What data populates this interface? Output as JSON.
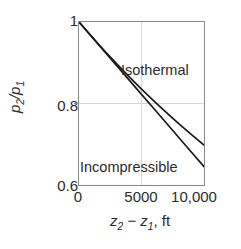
{
  "figure": {
    "background_color": "#ffffff",
    "frame_color": "#8a8a8a",
    "grid_color": "#d8d8d8",
    "line_color": "#1a1a1a"
  },
  "chart_data": {
    "type": "line",
    "title": "",
    "xlabel": "z2 - z1, ft",
    "ylabel": "p2/p1",
    "xlim": [
      0,
      10000
    ],
    "ylim": [
      0.6,
      1.0
    ],
    "xticks": [
      0,
      5000,
      10000
    ],
    "xticklabels": [
      "0",
      "5000",
      "10,000"
    ],
    "yticks": [
      0.6,
      0.8,
      1.0
    ],
    "yticklabels": [
      "0.6",
      "0.8",
      "1"
    ],
    "grid": true,
    "grid_axes": "both",
    "legend": "inline-annotations",
    "series": [
      {
        "name": "Isothermal",
        "label_position": "upper-right-inside",
        "x": [
          0,
          1000,
          2000,
          3000,
          4000,
          5000,
          6000,
          7000,
          8000,
          9000,
          10000
        ],
        "values": [
          1.0,
          0.9647,
          0.9307,
          0.8978,
          0.8661,
          0.8355,
          0.806,
          0.7775,
          0.75,
          0.7235,
          0.6979
        ]
      },
      {
        "name": "Incompressible",
        "label_position": "lower-left-inside",
        "x": [
          0,
          1000,
          2000,
          3000,
          4000,
          5000,
          6000,
          7000,
          8000,
          9000,
          10000
        ],
        "values": [
          1.0,
          0.9645,
          0.929,
          0.8935,
          0.858,
          0.8225,
          0.787,
          0.7515,
          0.716,
          0.6805,
          0.645
        ]
      }
    ],
    "annotations": [
      {
        "text": "Isothermal",
        "x": 4000,
        "y": 0.945
      },
      {
        "text": "Incompressible",
        "x": 250,
        "y": 0.7
      }
    ]
  },
  "axis": {
    "y_tick_top": "1",
    "y_tick_mid": "0.8",
    "y_tick_bottom": "0.6",
    "x_tick_0": "0",
    "x_tick_5000": "5000",
    "x_tick_10000": "10,000",
    "y_title_num": "p",
    "y_title_sub1": "2",
    "y_title_slash": "/",
    "y_title_den": "p",
    "y_title_sub2": "1",
    "x_title_z1": "z",
    "x_title_sub1": "2",
    "x_title_minus": " − ",
    "x_title_z2": "z",
    "x_title_sub2": "1",
    "x_title_unit": ", ft"
  },
  "labels": {
    "isothermal": "Isothermal",
    "incompressible": "Incompressible"
  }
}
